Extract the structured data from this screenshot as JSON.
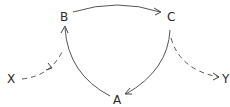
{
  "diagram": {
    "nodes": {
      "B": {
        "label": "B",
        "x": 64,
        "y": 21
      },
      "C": {
        "label": "C",
        "x": 171,
        "y": 21
      },
      "X": {
        "label": "X",
        "x": 11,
        "y": 83
      },
      "Y": {
        "label": "Y",
        "x": 227,
        "y": 83
      },
      "A": {
        "label": "A",
        "x": 117,
        "y": 104
      }
    },
    "edges": [
      {
        "from": "B",
        "to": "C",
        "style": "solid"
      },
      {
        "from": "C",
        "to": "A",
        "style": "solid"
      },
      {
        "from": "A",
        "to": "B",
        "style": "solid"
      },
      {
        "from": "X",
        "to": "B",
        "style": "dashed"
      },
      {
        "from": "C",
        "to": "Y",
        "style": "dashed"
      }
    ],
    "colors": {
      "stroke": "#555555",
      "text": "#2a2a2a",
      "background": "#ffffff"
    }
  }
}
